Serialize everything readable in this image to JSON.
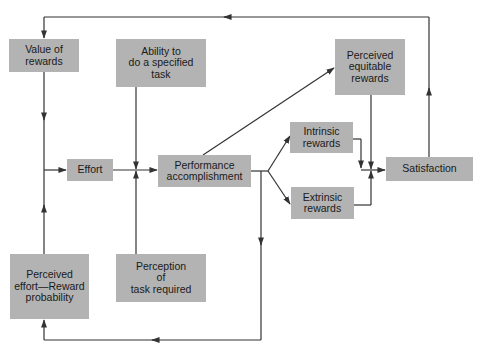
{
  "diagram": {
    "type": "flowchart",
    "box_color": "#b3b3b3",
    "line_color": "#333333",
    "nodes": {
      "value_of_rewards": {
        "label": "Value of\nrewards"
      },
      "ability": {
        "label": "Ability to\ndo a specified\ntask"
      },
      "perceived_equitable": {
        "label": "Perceived\nequitable\nrewards"
      },
      "effort": {
        "label": "Effort"
      },
      "performance": {
        "label": "Performance\naccomplishment"
      },
      "intrinsic": {
        "label": "Intrinsic\nrewards"
      },
      "extrinsic": {
        "label": "Extrinsic\nrewards"
      },
      "satisfaction": {
        "label": "Satisfaction"
      },
      "perceived_effort": {
        "label": "Perceived\neffort—Reward\nprobability"
      },
      "perception_task": {
        "label": "Perception\nof\ntask required"
      }
    },
    "edges": [
      {
        "from": "Value of rewards",
        "to": "Effort"
      },
      {
        "from": "Perceived effort—Reward probability",
        "to": "Effort"
      },
      {
        "from": "Effort",
        "to": "Performance accomplishment"
      },
      {
        "from": "Ability to do a specified task",
        "to": "Performance accomplishment"
      },
      {
        "from": "Perception of task required",
        "to": "Performance accomplishment"
      },
      {
        "from": "Performance accomplishment",
        "to": "Perceived equitable rewards"
      },
      {
        "from": "Performance accomplishment",
        "to": "Intrinsic rewards"
      },
      {
        "from": "Performance accomplishment",
        "to": "Extrinsic rewards"
      },
      {
        "from": "Performance accomplishment",
        "to": "Perceived effort—Reward probability"
      },
      {
        "from": "Intrinsic rewards",
        "to": "Satisfaction"
      },
      {
        "from": "Extrinsic rewards",
        "to": "Satisfaction"
      },
      {
        "from": "Perceived equitable rewards",
        "to": "Satisfaction"
      },
      {
        "from": "Satisfaction",
        "to": "Value of rewards"
      }
    ]
  }
}
